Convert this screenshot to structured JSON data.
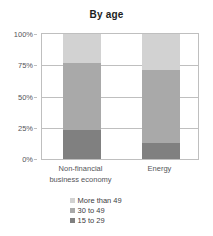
{
  "chart_data": {
    "type": "bar",
    "subtype": "stacked-percentage-column",
    "title": "By age",
    "xlabel": "",
    "ylabel": "",
    "ylim": [
      0,
      100
    ],
    "yunit": "%",
    "grid": true,
    "legend_position": "bottom",
    "categories": [
      "Non-financial business economy",
      "Energy"
    ],
    "category_lines": [
      [
        "Non-financial",
        "business economy"
      ],
      [
        "Energy"
      ]
    ],
    "ytick_labels": [
      "100%",
      "75%",
      "50%",
      "25%",
      "0%"
    ],
    "ytick_values": [
      100,
      75,
      50,
      25,
      0
    ],
    "series": [
      {
        "name": "15 to 29",
        "color": "#808080",
        "values": [
          23,
          13
        ]
      },
      {
        "name": "30 to 49",
        "color": "#a9a9a9",
        "values": [
          54,
          58
        ]
      },
      {
        "name": "More than 49",
        "color": "#d2d2d2",
        "values": [
          23,
          29
        ]
      }
    ],
    "legend_entries": [
      {
        "label": "More than 49",
        "color": "#d2d2d2"
      },
      {
        "label": "30 to 49",
        "color": "#a9a9a9"
      },
      {
        "label": "15 to 29",
        "color": "#808080"
      }
    ],
    "colors": {
      "axis": "#bfbfbf",
      "grid": "#bfbfbf",
      "text": "#55555a",
      "title": "#1d1d1d",
      "background": "#ffffff"
    }
  }
}
